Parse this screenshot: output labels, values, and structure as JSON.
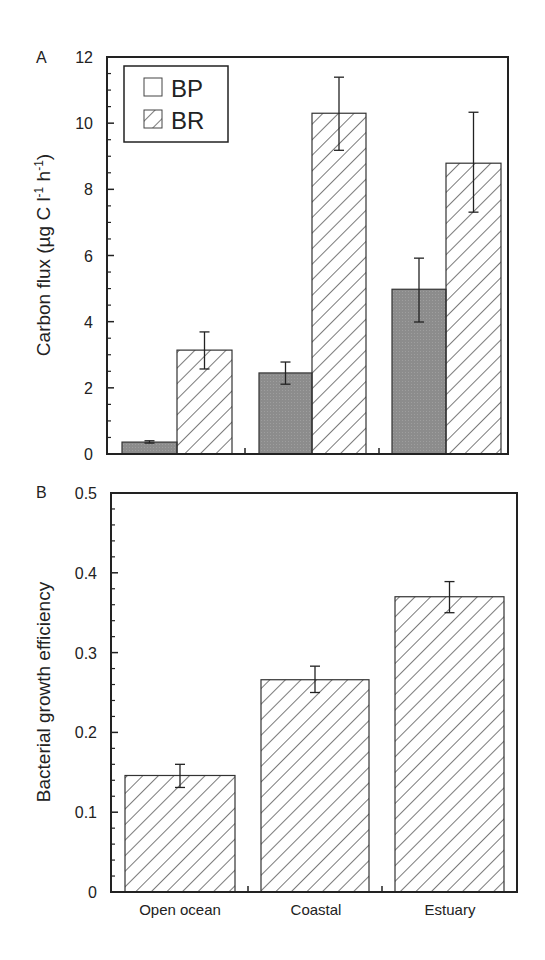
{
  "chart_data": [
    {
      "panel_label": "A",
      "type": "bar",
      "title": "",
      "xlabel": "",
      "ylabel": "Carbon flux (µg C l⁻¹ h⁻¹)",
      "ylim": [
        0,
        12
      ],
      "yticks": [
        0,
        2,
        4,
        6,
        8,
        10,
        12
      ],
      "categories": [
        "Open ocean",
        "Coastal",
        "Estuary"
      ],
      "legend": {
        "position": "upper-left",
        "entries": [
          "BP",
          "BR"
        ]
      },
      "series": [
        {
          "name": "BP",
          "pattern": "solid-gray",
          "values": [
            0.36,
            2.45,
            4.98
          ],
          "err_low": [
            0.33,
            2.11,
            3.99
          ],
          "err_high": [
            0.4,
            2.78,
            5.92
          ]
        },
        {
          "name": "BR",
          "pattern": "diagonal-hatch",
          "values": [
            3.14,
            10.3,
            8.79
          ],
          "err_low": [
            2.57,
            9.18,
            7.31
          ],
          "err_high": [
            3.69,
            11.39,
            10.33
          ]
        }
      ]
    },
    {
      "panel_label": "B",
      "type": "bar",
      "title": "",
      "xlabel": "",
      "ylabel": "Bacterial growth efficiency",
      "ylim": [
        0,
        0.5
      ],
      "yticks": [
        0,
        0.1,
        0.2,
        0.3,
        0.4,
        0.5
      ],
      "categories": [
        "Open ocean",
        "Coastal",
        "Estuary"
      ],
      "series": [
        {
          "name": "BGE",
          "pattern": "diagonal-hatch",
          "values": [
            0.146,
            0.266,
            0.37
          ],
          "err_low": [
            0.131,
            0.25,
            0.35
          ],
          "err_high": [
            0.16,
            0.283,
            0.389
          ]
        }
      ]
    }
  ],
  "panels": {
    "a": {
      "label": "A",
      "ylabel": "Carbon flux (µg C l⁻¹ h⁻¹)",
      "legend_bp": "BP",
      "legend_br": "BR"
    },
    "b": {
      "label": "B",
      "ylabel": "Bacterial growth efficiency"
    }
  },
  "categories": [
    "Open ocean",
    "Coastal",
    "Estuary"
  ],
  "colors": {
    "bp_fill": "#8c8c8c",
    "axis": "#222222",
    "hatch": "#333333"
  }
}
